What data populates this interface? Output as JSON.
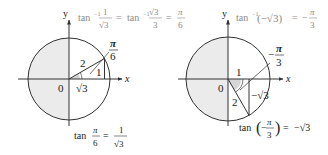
{
  "diagrams": [
    {
      "id": "left",
      "angle_label_num": "π",
      "angle_label_den": "6",
      "hypotenuse": "2",
      "opposite": "1",
      "adjacent": "√3",
      "origin": "0",
      "x_axis": "x",
      "y_axis": "y",
      "top_equation": {
        "p1": "tan",
        "p1_sup": "−1",
        "frac1_num": "1",
        "frac1_den": "√3",
        "eq1": "=",
        "p2": "tan",
        "p2_sup": "−1",
        "frac2_num": "√3",
        "frac2_den": "3",
        "eq2": "=",
        "frac3_num": "π",
        "frac3_den": "6"
      },
      "bottom_equation": {
        "fn": "tan",
        "frac1_num": "π",
        "frac1_den": "6",
        "eq": "=",
        "frac2_num": "1",
        "frac2_den": "√3"
      }
    },
    {
      "id": "right",
      "angle_label_sign": "−",
      "angle_label_num": "π",
      "angle_label_den": "3",
      "hypotenuse": "2",
      "adjacent": "1",
      "opposite": "−√3",
      "origin": "0",
      "x_axis": "x",
      "y_axis": "y",
      "top_equation": {
        "fn": "tan",
        "fn_sup": "−1",
        "arg": "(−√3)",
        "eq": "=",
        "sign": "−",
        "frac_num": "π",
        "frac_den": "3"
      },
      "bottom_equation": {
        "fn": "tan",
        "lparen": "(",
        "sign": "−",
        "frac_num": "π",
        "frac_den": "3",
        "rparen": ")",
        "eq": "=",
        "rhs": "−√3"
      }
    }
  ],
  "colors": {
    "shade": "#ebebeb",
    "line": "#333333",
    "top_equation_text": "#8a8a8a",
    "angle_wedge": "#d6d6d6"
  }
}
